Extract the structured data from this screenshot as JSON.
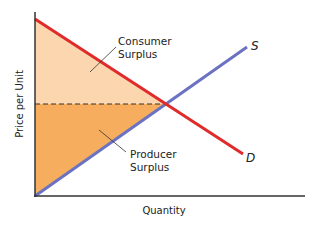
{
  "diagram": {
    "axes": {
      "y_label": "Price per Unit",
      "x_label": "Quantity"
    },
    "curves": {
      "supply": {
        "label": "S",
        "color": "#6B72C2"
      },
      "demand": {
        "label": "D",
        "color": "#E02B2B"
      }
    },
    "regions": {
      "consumer_surplus": {
        "label_line1": "Consumer",
        "label_line2": "Surplus",
        "color": "#FBD6AF"
      },
      "producer_surplus": {
        "label_line1": "Producer",
        "label_line2": "Surplus",
        "color": "#F6AE5E"
      }
    },
    "equilibrium_price_line": "dashed"
  }
}
